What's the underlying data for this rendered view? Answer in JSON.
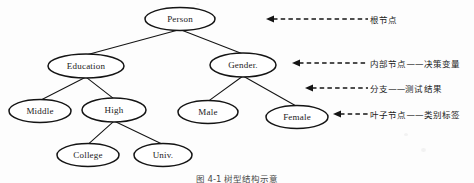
{
  "figure": {
    "kind": "decision-tree-diagram",
    "caption": "图 4-1  树型结构示意",
    "ink_color": "#141414",
    "background_color": "#fdfdfd"
  },
  "tree": {
    "nodes": [
      {
        "id": "person",
        "label": "Person",
        "cx": 180,
        "cy": 19,
        "rx": 35,
        "ry": 11.5,
        "level": 0,
        "role": "root"
      },
      {
        "id": "education",
        "label": "Education",
        "cx": 86,
        "cy": 66,
        "rx": 38,
        "ry": 12,
        "level": 1,
        "role": "internal"
      },
      {
        "id": "gender",
        "label": "Gender.",
        "cx": 243,
        "cy": 65,
        "rx": 33,
        "ry": 12,
        "level": 1,
        "role": "internal"
      },
      {
        "id": "middle",
        "label": "Middle",
        "cx": 40,
        "cy": 111,
        "rx": 31,
        "ry": 11.5,
        "level": 2,
        "role": "leaf"
      },
      {
        "id": "high",
        "label": "High",
        "cx": 114,
        "cy": 110,
        "rx": 32,
        "ry": 12,
        "level": 2,
        "role": "internal"
      },
      {
        "id": "male",
        "label": "Male",
        "cx": 208,
        "cy": 112,
        "rx": 30,
        "ry": 11.5,
        "level": 2,
        "role": "leaf"
      },
      {
        "id": "female",
        "label": "Female",
        "cx": 297,
        "cy": 117,
        "rx": 31,
        "ry": 11.5,
        "level": 2,
        "role": "leaf"
      },
      {
        "id": "college",
        "label": "College",
        "cx": 88,
        "cy": 155,
        "rx": 31,
        "ry": 11.5,
        "level": 3,
        "role": "leaf"
      },
      {
        "id": "univ",
        "label": "Univ.",
        "cx": 163,
        "cy": 155,
        "rx": 29,
        "ry": 11.5,
        "level": 3,
        "role": "leaf"
      }
    ],
    "edges": [
      {
        "from": "person",
        "to": "education"
      },
      {
        "from": "person",
        "to": "gender"
      },
      {
        "from": "education",
        "to": "middle"
      },
      {
        "from": "education",
        "to": "high"
      },
      {
        "from": "gender",
        "to": "male"
      },
      {
        "from": "gender",
        "to": "female"
      },
      {
        "from": "high",
        "to": "college"
      },
      {
        "from": "high",
        "to": "univ"
      }
    ]
  },
  "annotations": [
    {
      "id": "root-node",
      "text": "根节点",
      "arrow_head_x": 266,
      "arrow_tail_x": 368,
      "y": 19,
      "text_x": 370
    },
    {
      "id": "internal-node",
      "text": "内部节点——决策变量",
      "arrow_head_x": 292,
      "arrow_tail_x": 368,
      "y": 63,
      "text_x": 370
    },
    {
      "id": "branch",
      "text": "分支——测试结果",
      "arrow_head_x": 305,
      "arrow_tail_x": 368,
      "y": 88,
      "text_x": 370
    },
    {
      "id": "leaf-node",
      "text": "叶子节点——类别标签",
      "arrow_head_x": 333,
      "arrow_tail_x": 368,
      "y": 114,
      "text_x": 370
    }
  ]
}
